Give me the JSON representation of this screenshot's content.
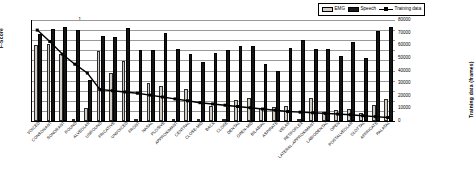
{
  "legend": {
    "items": [
      {
        "label": "EMG",
        "type": "bar",
        "color": "#d0ccc4",
        "name": "legend-emg"
      },
      {
        "label": "Speech",
        "type": "bar",
        "color": "#141414",
        "name": "legend-speech"
      },
      {
        "label": "Training data",
        "type": "line",
        "color": "#000000",
        "name": "legend-training-data"
      }
    ]
  },
  "axes": {
    "left": {
      "title": "F-Score",
      "ticks": [
        "0",
        "0.1",
        "0.2",
        "0.3",
        "0.4",
        "0.5",
        "0.6",
        "0.7",
        "0.8",
        "0.9",
        "1"
      ],
      "min": 0,
      "max": 1
    },
    "right": {
      "title": "Training data (frames)",
      "ticks": [
        "0",
        "10000",
        "20000",
        "30000",
        "40000",
        "50000",
        "60000",
        "70000",
        "80000"
      ],
      "min": 0,
      "max": 80000
    }
  },
  "chart_data": {
    "type": "bar",
    "title": "",
    "xlabel": "",
    "ylabel": "F-Score",
    "y2label": "Training data (frames)",
    "ylim": [
      0,
      1
    ],
    "y2lim": [
      0,
      80000
    ],
    "grid": true,
    "legend_position": "top-right",
    "categories": [
      "VOICED",
      "CONSONANT",
      "SONORANT",
      "ROUND",
      "ALVEOLAR",
      "UNROUND",
      "FRICATIVE",
      "UNVOICED",
      "FRONT",
      "NASAL",
      "PLOSIVE",
      "APPROXIMANT",
      "CENTRAL",
      "CLOSE-MID",
      "BACK",
      "CLOSE",
      "DENTAL",
      "OPEN-MID",
      "BILABIAL",
      "ASPIRATE",
      "VELAR",
      "RETROFLEX",
      "LATERAL-APPROXIMANT",
      "LABIODENTAL",
      "OPEN",
      "POSTALVEOLAR",
      "GLOTTAL",
      "AFFRICATE",
      "PALATAL"
    ],
    "series": [
      {
        "name": "EMG",
        "axis": "left",
        "color": "#d0ccc4",
        "values": [
          0.75,
          0.76,
          0.66,
          0.0,
          0.13,
          0.69,
          0.48,
          0.59,
          0.0,
          0.38,
          0.35,
          0.0,
          0.32,
          0.0,
          0.15,
          0.0,
          0.21,
          0.23,
          0.13,
          0.14,
          0.15,
          0.0,
          0.23,
          0.09,
          0.11,
          0.12,
          0.08,
          0.16,
          0.22
        ]
      },
      {
        "name": "Speech",
        "axis": "left",
        "color": "#141414",
        "values": [
          0.86,
          0.91,
          0.93,
          0.9,
          0.41,
          0.84,
          0.83,
          0.92,
          0.7,
          0.7,
          0.87,
          0.71,
          0.66,
          0.58,
          0.67,
          0.7,
          0.74,
          0.74,
          0.56,
          0.5,
          0.72,
          0.8,
          0.71,
          0.71,
          0.64,
          0.78,
          0.62,
          0.89,
          0.93
        ]
      },
      {
        "name": "Training data",
        "axis": "right",
        "color": "#000000",
        "values": [
          72000,
          63000,
          53000,
          45000,
          38000,
          25000,
          24000,
          23000,
          22000,
          20500,
          19000,
          17500,
          16000,
          14500,
          13500,
          12500,
          11500,
          10500,
          9500,
          8500,
          7500,
          7000,
          6500,
          6000,
          5500,
          5000,
          4200,
          3500,
          2800
        ]
      }
    ]
  }
}
